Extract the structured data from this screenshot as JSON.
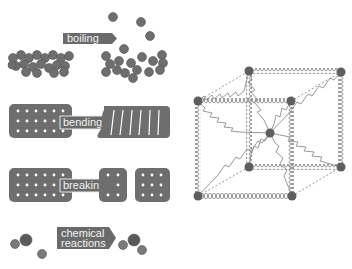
{
  "colors": {
    "atom": "#6e6e6e",
    "atom_dark": "#555555",
    "label_bg": "#6a6a6a",
    "label_text": "#f2f2f2",
    "spring": "#8c8c8c",
    "node": "#5e5e5e",
    "background": "#ffffff"
  },
  "labels": {
    "boiling": "boiling",
    "bending": "bending",
    "breaking": "breaking",
    "chemical_line1": "chemical",
    "chemical_line2": "reactions"
  },
  "panels": [
    {
      "id": "boiling",
      "description": "clustered atoms become dispersed gas atoms"
    },
    {
      "id": "bending",
      "description": "atom lattice bends under force"
    },
    {
      "id": "breaking",
      "description": "atom lattice splits into two pieces"
    },
    {
      "id": "chemical-reactions",
      "description": "separate atoms combine into a molecule"
    }
  ],
  "cube_model": {
    "description": "atoms connected by springs in a cubic lattice",
    "nodes": 9
  }
}
